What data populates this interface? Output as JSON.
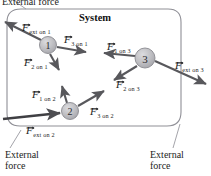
{
  "figure": {
    "type": "free-body-diagram",
    "system_label": "System",
    "boundary": {
      "shape": "rounded-rectangle",
      "stroke_color": "#8f8f96",
      "fill": "none"
    },
    "colors": {
      "particle_fill": "#b9b9bd",
      "particle_stroke": "#8a8a90",
      "arrow": "#58585c",
      "text": "#1d1d1d",
      "boundary": "#8f8f96",
      "leader": "#9a9aa0"
    }
  },
  "particles": [
    {
      "id": "1",
      "label": "1",
      "cx": 48,
      "cy": 45,
      "r": 8.5
    },
    {
      "id": "2",
      "label": "2",
      "cx": 70,
      "cy": 111,
      "r": 8.5
    },
    {
      "id": "3",
      "label": "3",
      "cx": 145,
      "cy": 58,
      "r": 10
    }
  ],
  "forces": [
    {
      "name": "F_ext_on_1",
      "symbol": "F",
      "subscript": "ext on 1",
      "kind": "external",
      "acts_on": "1",
      "label_x": 22,
      "label_y": 19,
      "from": [
        41,
        40
      ],
      "to": [
        3,
        21
      ]
    },
    {
      "name": "F_3_on_1",
      "symbol": "F",
      "subscript": "3 on 1",
      "kind": "internal",
      "acts_on": "1",
      "label_x": 63,
      "label_y": 31,
      "from": [
        57,
        47
      ],
      "to": [
        87,
        52
      ]
    },
    {
      "name": "F_2_on_1",
      "symbol": "F",
      "subscript": "2 on 1",
      "kind": "internal",
      "acts_on": "1",
      "label_x": 24,
      "label_y": 54,
      "from": [
        50,
        54
      ],
      "to": [
        59,
        71
      ]
    },
    {
      "name": "F_1_on_2",
      "symbol": "F",
      "subscript": "1 on 2",
      "kind": "internal",
      "acts_on": "2",
      "label_x": 33,
      "label_y": 86,
      "from": [
        67,
        103
      ],
      "to": [
        62,
        85
      ]
    },
    {
      "name": "F_3_on_2",
      "symbol": "F",
      "subscript": "3 on 2",
      "kind": "internal",
      "acts_on": "2",
      "label_x": 91,
      "label_y": 103,
      "from": [
        78,
        106
      ],
      "to": [
        105,
        90
      ]
    },
    {
      "name": "F_ext_on_2",
      "symbol": "F",
      "subscript": "ext on 2",
      "kind": "external",
      "acts_on": "2",
      "label_x": 27,
      "label_y": 122,
      "from": [
        4,
        119
      ],
      "to": [
        61,
        113
      ]
    },
    {
      "name": "F_1_on_3",
      "symbol": "F",
      "subscript": "1 on 3",
      "kind": "internal",
      "acts_on": "3",
      "label_x": 108,
      "label_y": 38,
      "from": [
        135,
        56
      ],
      "to": [
        104,
        53
      ]
    },
    {
      "name": "F_2_on_3",
      "symbol": "F",
      "subscript": "2 on 3",
      "kind": "internal",
      "acts_on": "3",
      "label_x": 117,
      "label_y": 76,
      "from": [
        137,
        66
      ],
      "to": [
        113,
        81
      ]
    },
    {
      "name": "F_ext_on_3",
      "symbol": "F",
      "subscript": "ext on 3",
      "kind": "external",
      "acts_on": "3",
      "label_x": 176,
      "label_y": 57,
      "from": [
        155,
        61
      ],
      "to": [
        207,
        84
      ]
    }
  ],
  "annotations": {
    "top_external": {
      "line1": "External force",
      "x": 2,
      "y": -2
    },
    "bottom_left_external": {
      "line1": "External",
      "line2": "force",
      "x": 8,
      "y": 150
    },
    "bottom_right_external": {
      "line1": "External",
      "line2": "force",
      "x": 152,
      "y": 150
    }
  },
  "leaders": [
    {
      "name": "leader-top-left",
      "from": [
        26,
        8
      ],
      "to": [
        14,
        0
      ]
    },
    {
      "name": "leader-bottom-left",
      "from": [
        21,
        131
      ],
      "to": [
        10,
        148
      ]
    },
    {
      "name": "leader-bottom-right",
      "from": [
        178,
        126
      ],
      "to": [
        172,
        148
      ]
    }
  ]
}
